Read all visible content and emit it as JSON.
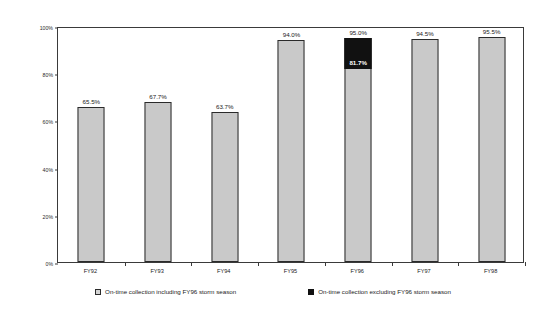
{
  "chart_data": {
    "type": "bar",
    "title": "",
    "xlabel": "",
    "ylabel": "On-time Collection Percentage",
    "ylim": [
      0,
      100
    ],
    "grid": false,
    "legend_position": "bottom",
    "categories": [
      "FY92",
      "FY93",
      "FY94",
      "FY95",
      "FY96",
      "FY97",
      "FY98"
    ],
    "ytick_labels": [
      "0%",
      "20%",
      "40%",
      "60%",
      "80%",
      "100%"
    ],
    "ytick_values": [
      0,
      20,
      40,
      60,
      80,
      100
    ],
    "series": [
      {
        "name": "On-time collection including FY96 storm season",
        "color": "#c9c9c9",
        "values": [
          65.5,
          67.7,
          63.7,
          94.0,
          95.0,
          94.5,
          95.5
        ],
        "value_labels": [
          "65.5%",
          "67.7%",
          "63.7%",
          "94.0%",
          "95.0%",
          "94.5%",
          "95.5%"
        ]
      },
      {
        "name": "On-time collection excluding FY96 storm season",
        "color": "#111111",
        "values": [
          null,
          null,
          null,
          null,
          81.7,
          null,
          null
        ],
        "value_labels": [
          null,
          null,
          null,
          null,
          "81.7%",
          null,
          null
        ]
      }
    ],
    "annotations": [
      {
        "text": "81.7%",
        "category": "FY96",
        "value": 81.7,
        "note": "white label inside black segment of FY96 bar"
      }
    ]
  },
  "legend": {
    "items": [
      {
        "label": "On-time collection including FY96 storm season",
        "swatch": "light"
      },
      {
        "label": "On-time collection excluding FY96 storm season",
        "swatch": "dark"
      }
    ]
  }
}
